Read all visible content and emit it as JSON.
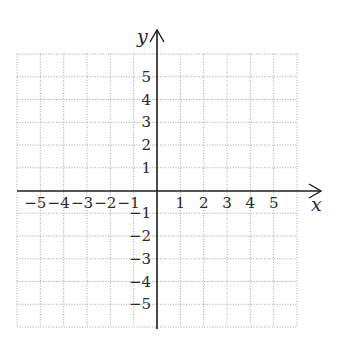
{
  "chart_data": {
    "type": "line",
    "title": "",
    "xlabel": "x",
    "ylabel": "y",
    "xlim": [
      -6,
      6
    ],
    "ylim": [
      -6,
      6
    ],
    "grid": true,
    "grid_style": "dotted",
    "x_tick_labels": [
      "−5",
      "−4",
      "−3",
      "−2",
      "−1",
      "1",
      "2",
      "3",
      "4",
      "5"
    ],
    "x_tick_values": [
      -5,
      -4,
      -3,
      -2,
      -1,
      1,
      2,
      3,
      4,
      5
    ],
    "y_tick_labels": [
      "5",
      "4",
      "3",
      "2",
      "1",
      "−1",
      "−2",
      "−3",
      "−4",
      "−5"
    ],
    "y_tick_values": [
      5,
      4,
      3,
      2,
      1,
      -1,
      -2,
      -3,
      -4,
      -5
    ],
    "series": [],
    "legend": null
  },
  "axes": {
    "x_label": "x",
    "y_label": "y"
  },
  "colors": {
    "axis": "#1e1e1e",
    "grid": "#9a9a9a",
    "text": "#2a2a2a"
  }
}
